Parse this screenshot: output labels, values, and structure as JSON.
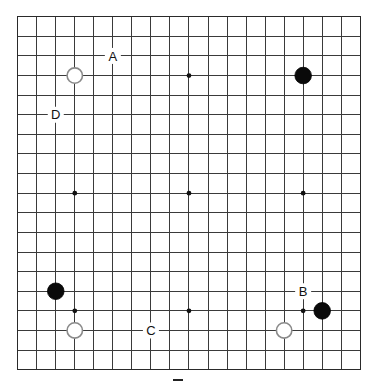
{
  "board": {
    "size": 19,
    "origin_x": 17.7,
    "origin_y": 16.7,
    "spacing_x": 19.03,
    "spacing_y": 19.61,
    "stone_radius": 8.3,
    "hoshi_radius": 2.4,
    "colors": {
      "line": "#3a3a3a",
      "background": "#ffffff",
      "black_stone": "#0a0a0a",
      "white_stone_fill": "#ffffff",
      "white_stone_outline": "#8a8a8a"
    },
    "hoshi": [
      {
        "col": 3,
        "row": 3
      },
      {
        "col": 9,
        "row": 3
      },
      {
        "col": 15,
        "row": 3
      },
      {
        "col": 3,
        "row": 9
      },
      {
        "col": 9,
        "row": 9
      },
      {
        "col": 15,
        "row": 9
      },
      {
        "col": 3,
        "row": 15
      },
      {
        "col": 9,
        "row": 15
      },
      {
        "col": 15,
        "row": 15
      }
    ],
    "stones": [
      {
        "color": "white",
        "col": 3,
        "row": 3
      },
      {
        "color": "black",
        "col": 15,
        "row": 3
      },
      {
        "color": "black",
        "col": 2,
        "row": 14
      },
      {
        "color": "white",
        "col": 3,
        "row": 16
      },
      {
        "color": "white",
        "col": 14,
        "row": 16
      },
      {
        "color": "black",
        "col": 16,
        "row": 15
      }
    ],
    "labels": [
      {
        "text": "A",
        "col": 5,
        "row": 2
      },
      {
        "text": "D",
        "col": 2,
        "row": 5
      },
      {
        "text": "B",
        "col": 15,
        "row": 14
      },
      {
        "text": "C",
        "col": 7,
        "row": 16
      }
    ]
  },
  "caption": {
    "visible": "partially cropped glyph at bottom edge"
  }
}
